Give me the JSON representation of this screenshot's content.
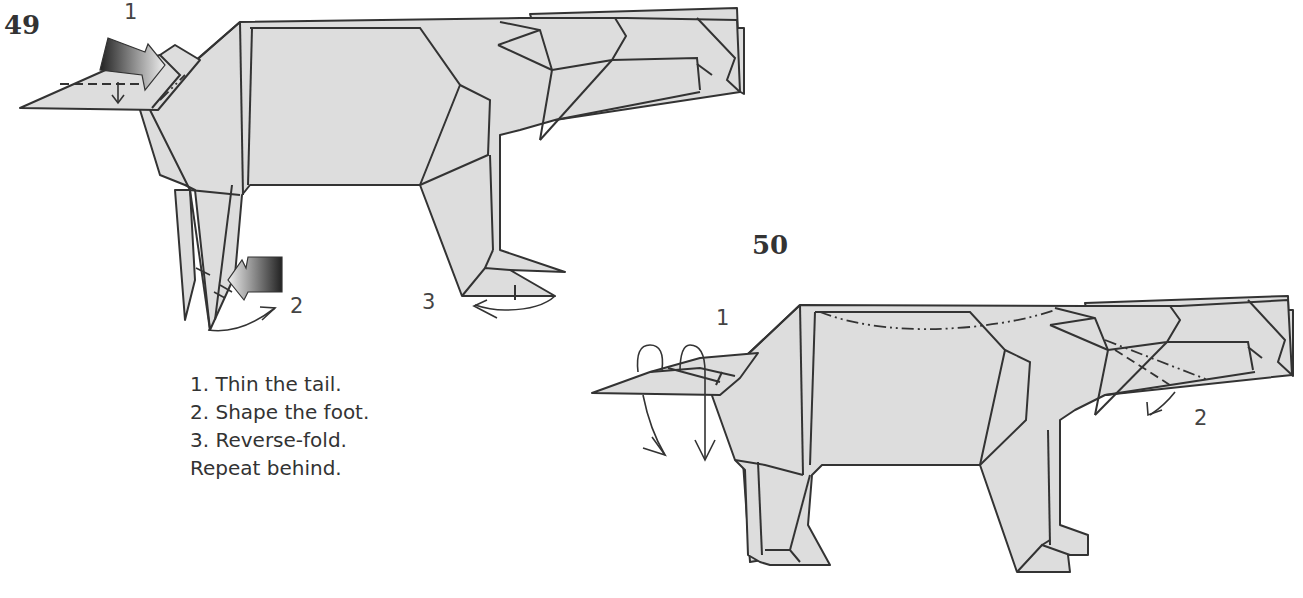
{
  "diagram": {
    "type": "origami-instructions",
    "colors": {
      "paper": "#dddddd",
      "line": "#333333",
      "background": "#ffffff"
    },
    "steps": [
      {
        "number": "49",
        "callouts": [
          "1",
          "2",
          "3"
        ],
        "instructions": [
          "1. Thin the tail.",
          "2. Shape the foot.",
          "3. Reverse-fold.",
          "Repeat behind."
        ],
        "symbols": [
          "push-arrow-tail",
          "push-arrow-foot",
          "fold-arrow-foot",
          "reverse-fold-arrow"
        ]
      },
      {
        "number": "50",
        "callouts": [
          "1",
          "2"
        ],
        "symbols": [
          "wrap-arrow-tail",
          "mountain-fold-back",
          "fold-arrow-head"
        ]
      }
    ]
  }
}
